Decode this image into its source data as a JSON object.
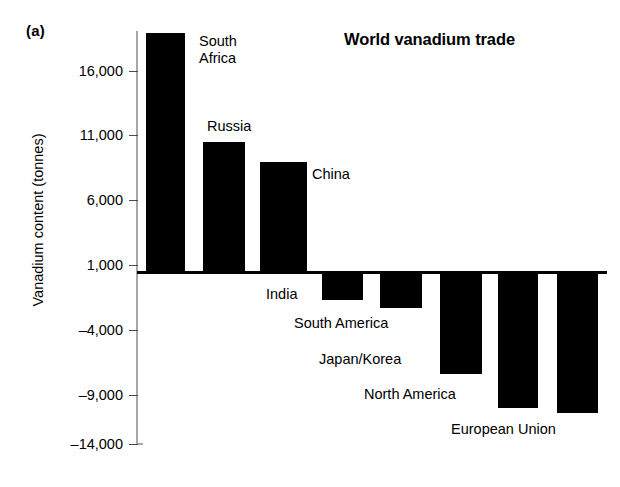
{
  "panel": {
    "label": "(a)"
  },
  "chart_data": {
    "type": "bar",
    "title": "World vanadium trade",
    "xlabel": "",
    "ylabel": "Vanadium content (tonnes)",
    "categories": [
      "South Africa",
      "Russia",
      "China",
      "India",
      "South America",
      "Japan/Korea",
      "North America",
      "European Union"
    ],
    "values": [
      18400,
      10000,
      8460,
      -2150,
      -2770,
      -7850,
      -10460,
      -10850
    ],
    "ylim": [
      -14000,
      19000
    ],
    "yticks": [
      16000,
      11000,
      6000,
      1000,
      -4000,
      -9000,
      -14000
    ],
    "ytick_labels": [
      "16,000",
      "11,000",
      "6,000",
      "1,000",
      "–4,000",
      "–9,000",
      "–14,000"
    ],
    "grid": false,
    "legend": false,
    "bar_color": "#000000",
    "zero_reference_line": 0,
    "annotations": [
      {
        "text": "South\nAfrica",
        "series_index": 0
      },
      {
        "text": "Russia",
        "series_index": 1
      },
      {
        "text": "China",
        "series_index": 2
      },
      {
        "text": "India",
        "series_index": 3
      },
      {
        "text": "South America",
        "series_index": 4
      },
      {
        "text": "Japan/Korea",
        "series_index": 5
      },
      {
        "text": "North America",
        "series_index": 6
      },
      {
        "text": "European Union",
        "series_index": 7
      }
    ]
  },
  "geometry": {
    "zero_y": 272,
    "tick_y": [
      71,
      135,
      200,
      265,
      330,
      395,
      444
    ],
    "bars": [
      {
        "x": 146,
        "w": 39,
        "top": 33,
        "bottom": 272
      },
      {
        "x": 203,
        "w": 42,
        "top": 142,
        "bottom": 272
      },
      {
        "x": 260,
        "w": 47,
        "top": 162,
        "bottom": 272
      },
      {
        "x": 322,
        "w": 41,
        "top": 272,
        "bottom": 300
      },
      {
        "x": 380,
        "w": 42,
        "top": 272,
        "bottom": 308
      },
      {
        "x": 440,
        "w": 42,
        "top": 272,
        "bottom": 374
      },
      {
        "x": 498,
        "w": 40,
        "top": 272,
        "bottom": 408
      },
      {
        "x": 557,
        "w": 41,
        "top": 272,
        "bottom": 413
      }
    ],
    "labels": [
      {
        "x": 199,
        "y": 33
      },
      {
        "x": 207,
        "y": 118
      },
      {
        "x": 312,
        "y": 166
      },
      {
        "x": 266,
        "y": 286
      },
      {
        "x": 294,
        "y": 315
      },
      {
        "x": 319,
        "y": 351
      },
      {
        "x": 364,
        "y": 386
      },
      {
        "x": 451,
        "y": 421
      }
    ]
  }
}
